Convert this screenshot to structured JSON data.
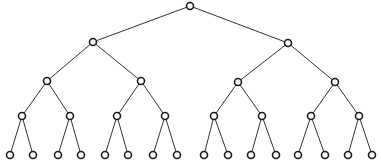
{
  "diagram": {
    "type": "binary-tree",
    "depth": 4,
    "colors": {
      "edge": "#333333",
      "node_stroke": "#1a1a1a",
      "node_fill": "#ffffff",
      "background": "#ffffff"
    },
    "node_radius": 3.5,
    "nodes": [
      {
        "id": "n0",
        "x": 190,
        "y": 6
      },
      {
        "id": "n1",
        "x": 93,
        "y": 42
      },
      {
        "id": "n2",
        "x": 288,
        "y": 43
      },
      {
        "id": "n3",
        "x": 47,
        "y": 81
      },
      {
        "id": "n4",
        "x": 141,
        "y": 81
      },
      {
        "id": "n5",
        "x": 238,
        "y": 82
      },
      {
        "id": "n6",
        "x": 335,
        "y": 82
      },
      {
        "id": "n7",
        "x": 22,
        "y": 116
      },
      {
        "id": "n8",
        "x": 70,
        "y": 116
      },
      {
        "id": "n9",
        "x": 117,
        "y": 116
      },
      {
        "id": "n10",
        "x": 165,
        "y": 116
      },
      {
        "id": "n11",
        "x": 214,
        "y": 116
      },
      {
        "id": "n12",
        "x": 262,
        "y": 116
      },
      {
        "id": "n13",
        "x": 311,
        "y": 116
      },
      {
        "id": "n14",
        "x": 359,
        "y": 116
      },
      {
        "id": "n15",
        "x": 10,
        "y": 155
      },
      {
        "id": "n16",
        "x": 33,
        "y": 155
      },
      {
        "id": "n17",
        "x": 58,
        "y": 155
      },
      {
        "id": "n18",
        "x": 81,
        "y": 155
      },
      {
        "id": "n19",
        "x": 105,
        "y": 155
      },
      {
        "id": "n20",
        "x": 128,
        "y": 155
      },
      {
        "id": "n21",
        "x": 153,
        "y": 155
      },
      {
        "id": "n22",
        "x": 177,
        "y": 155
      },
      {
        "id": "n23",
        "x": 204,
        "y": 155
      },
      {
        "id": "n24",
        "x": 228,
        "y": 155
      },
      {
        "id": "n25",
        "x": 251,
        "y": 155
      },
      {
        "id": "n26",
        "x": 276,
        "y": 155
      },
      {
        "id": "n27",
        "x": 298,
        "y": 155
      },
      {
        "id": "n28",
        "x": 325,
        "y": 155
      },
      {
        "id": "n29",
        "x": 348,
        "y": 155
      },
      {
        "id": "n30",
        "x": 372,
        "y": 155
      }
    ],
    "edges": [
      [
        "n0",
        "n1"
      ],
      [
        "n0",
        "n2"
      ],
      [
        "n1",
        "n3"
      ],
      [
        "n1",
        "n4"
      ],
      [
        "n2",
        "n5"
      ],
      [
        "n2",
        "n6"
      ],
      [
        "n3",
        "n7"
      ],
      [
        "n3",
        "n8"
      ],
      [
        "n4",
        "n9"
      ],
      [
        "n4",
        "n10"
      ],
      [
        "n5",
        "n11"
      ],
      [
        "n5",
        "n12"
      ],
      [
        "n6",
        "n13"
      ],
      [
        "n6",
        "n14"
      ],
      [
        "n7",
        "n15"
      ],
      [
        "n7",
        "n16"
      ],
      [
        "n8",
        "n17"
      ],
      [
        "n8",
        "n18"
      ],
      [
        "n9",
        "n19"
      ],
      [
        "n9",
        "n20"
      ],
      [
        "n10",
        "n21"
      ],
      [
        "n10",
        "n22"
      ],
      [
        "n11",
        "n23"
      ],
      [
        "n11",
        "n24"
      ],
      [
        "n12",
        "n25"
      ],
      [
        "n12",
        "n26"
      ],
      [
        "n13",
        "n27"
      ],
      [
        "n13",
        "n28"
      ],
      [
        "n14",
        "n29"
      ],
      [
        "n14",
        "n30"
      ]
    ]
  }
}
